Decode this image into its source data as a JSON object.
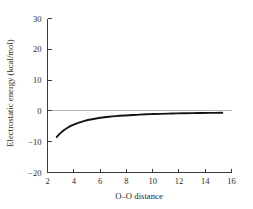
{
  "figure": {
    "background_color": "#ffffff",
    "axis_color": "#3a3a3a",
    "curve_color": "#141414",
    "zero_line_color": "#b9b9b9"
  },
  "chart_data": {
    "type": "line",
    "title": "",
    "subtitle": "",
    "xlabel": "O–O distance",
    "ylabel": "Electrostatic energy (kcal/mol)",
    "xlim": [
      2,
      16
    ],
    "ylim": [
      -20,
      30
    ],
    "xticks": [
      2,
      4,
      6,
      8,
      10,
      12,
      14,
      16
    ],
    "xticklabels": [
      "2",
      "4",
      "6",
      "8",
      "10",
      "12",
      "14",
      "16"
    ],
    "yticks": [
      -20,
      -10,
      0,
      10,
      20,
      30
    ],
    "yticklabels": [
      "−20",
      "−10",
      "0",
      "10",
      "20",
      "30"
    ],
    "grid": false,
    "legend": null,
    "annotations": [],
    "reference_lines": [
      {
        "name": "zero-energy-line",
        "axis": "y",
        "value": 0
      }
    ],
    "series": [
      {
        "name": "electrostatic-energy",
        "x": [
          2.7,
          2.8,
          2.9,
          3.0,
          3.15,
          3.3,
          3.5,
          3.7,
          3.9,
          4.15,
          4.4,
          4.7,
          5.0,
          5.4,
          5.8,
          6.2,
          6.7,
          7.2,
          7.8,
          8.4,
          9.0,
          9.8,
          10.6,
          11.5,
          12.4,
          13.4,
          14.4,
          15.3
        ],
        "y": [
          -8.5,
          -8.0,
          -7.55,
          -7.15,
          -6.6,
          -6.1,
          -5.55,
          -5.05,
          -4.65,
          -4.2,
          -3.8,
          -3.4,
          -3.05,
          -2.7,
          -2.4,
          -2.15,
          -1.9,
          -1.7,
          -1.5,
          -1.35,
          -1.2,
          -1.05,
          -0.95,
          -0.85,
          -0.75,
          -0.7,
          -0.65,
          -0.6
        ]
      }
    ]
  }
}
